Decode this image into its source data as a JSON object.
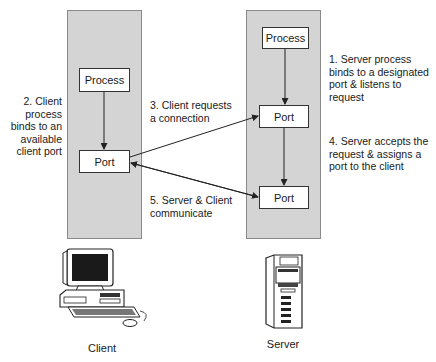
{
  "client": {
    "process_label": "Process",
    "port_label": "Port",
    "caption": "Client"
  },
  "server": {
    "process_label": "Process",
    "listen_port_label": "Port",
    "assigned_port_label": "Port",
    "caption": "Server"
  },
  "steps": {
    "step1": [
      "1. Server process",
      "binds to a designated",
      "port & listens to",
      "request"
    ],
    "step2": [
      "2. Client",
      "process",
      "binds to an",
      "available",
      "client port"
    ],
    "step3": [
      "3. Client requests",
      "a connection"
    ],
    "step4": [
      "4. Server accepts the",
      "request & assigns a",
      "port to the client"
    ],
    "step5": [
      "5. Server & Client",
      "communicate"
    ]
  },
  "colors": {
    "column_fill": "#d4d4d4",
    "box_fill": "#ffffff",
    "line": "#222222"
  }
}
